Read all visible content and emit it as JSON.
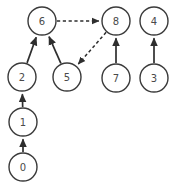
{
  "graph": {
    "title": "Directed dependency graph",
    "node_radius": 14,
    "node_fill": "#ffffff",
    "node_stroke": "#3a3a3a",
    "edge_color": "#2e2e2e",
    "background": "#ffffff",
    "nodes": [
      {
        "id": "0",
        "label": "0",
        "cx": 23,
        "cy": 167
      },
      {
        "id": "1",
        "label": "1",
        "cx": 23,
        "cy": 122
      },
      {
        "id": "2",
        "label": "2",
        "cx": 22,
        "cy": 77
      },
      {
        "id": "3",
        "label": "3",
        "cx": 154,
        "cy": 78
      },
      {
        "id": "4",
        "label": "4",
        "cx": 154,
        "cy": 21
      },
      {
        "id": "5",
        "label": "5",
        "cx": 67,
        "cy": 77
      },
      {
        "id": "6",
        "label": "6",
        "cx": 42,
        "cy": 21
      },
      {
        "id": "7",
        "label": "7",
        "cx": 116,
        "cy": 78
      },
      {
        "id": "8",
        "label": "8",
        "cx": 116,
        "cy": 21
      }
    ],
    "edges": [
      {
        "from": "0",
        "to": "1",
        "style": "solid",
        "arrow": true
      },
      {
        "from": "1",
        "to": "2",
        "style": "solid",
        "arrow": true
      },
      {
        "from": "2",
        "to": "6",
        "style": "solid",
        "arrow": true
      },
      {
        "from": "5",
        "to": "6",
        "style": "solid",
        "arrow": true
      },
      {
        "from": "7",
        "to": "8",
        "style": "solid",
        "arrow": true
      },
      {
        "from": "3",
        "to": "4",
        "style": "solid",
        "arrow": true
      },
      {
        "from": "6",
        "to": "8",
        "style": "dashed",
        "arrow": true
      },
      {
        "from": "8",
        "to": "5",
        "style": "dashed",
        "arrow": true
      }
    ]
  }
}
